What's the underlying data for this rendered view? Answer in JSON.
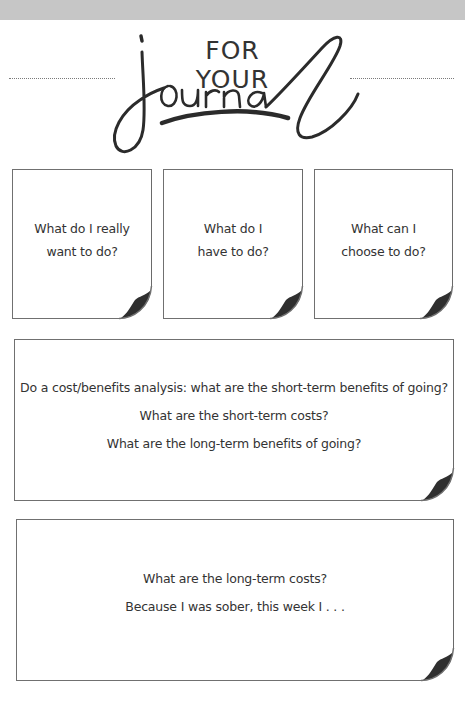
{
  "header": {
    "title_line1": "FOR YOUR",
    "title_line2": "journal"
  },
  "prompts": {
    "small": [
      {
        "lines": [
          "What do I really",
          "want to do?"
        ]
      },
      {
        "lines": [
          "What do I",
          "have to do?"
        ]
      },
      {
        "lines": [
          "What can I",
          "choose to do?"
        ]
      }
    ],
    "large": [
      {
        "lines": [
          "Do a cost/benefits analysis: what are the short-term benefits of going?",
          "What are the short-term costs?",
          "What are the long-term benefits of going?"
        ]
      },
      {
        "lines": [
          "What are the long-term costs?",
          "Because I was sober, this week I . . ."
        ]
      }
    ]
  },
  "colors": {
    "ink": "#2e2e2e",
    "border": "#707070",
    "band": "#c6c6c6"
  }
}
